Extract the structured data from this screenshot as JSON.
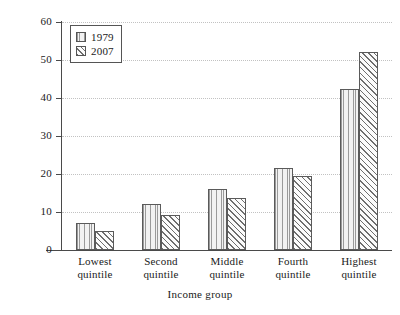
{
  "chart_data": {
    "type": "bar",
    "title": "",
    "subtitle": "",
    "xlabel": "Income group",
    "ylabel": "Per cent",
    "categories": [
      {
        "line1": "Lowest",
        "line2": "quintile"
      },
      {
        "line1": "Second",
        "line2": "quintile"
      },
      {
        "line1": "Middle",
        "line2": "quintile"
      },
      {
        "line1": "Fourth",
        "line2": "quintile"
      },
      {
        "line1": "Highest",
        "line2": "quintile"
      }
    ],
    "series": [
      {
        "name": "1979",
        "pattern": "vertical-lines",
        "values": [
          7.2,
          12.1,
          16.1,
          21.7,
          42.5
        ]
      },
      {
        "name": "2007",
        "pattern": "diagonal-hatch",
        "values": [
          5.1,
          9.1,
          13.8,
          19.5,
          52.2
        ]
      }
    ],
    "ylim": [
      0,
      60
    ],
    "yticks": [
      0,
      10,
      20,
      30,
      40,
      50,
      60
    ],
    "ytick_labels": [
      "0",
      "10",
      "20",
      "30",
      "40",
      "50",
      "60"
    ],
    "grid": "horizontal-dotted",
    "legend_position": "top-left",
    "colors": {
      "axis": "#4a4a4a",
      "grid": "#c2c2c2",
      "bar_outline": "#5a5a5a",
      "background": "#ffffff"
    }
  },
  "legend": {
    "entries": [
      {
        "label": "1979"
      },
      {
        "label": "2007"
      }
    ]
  }
}
